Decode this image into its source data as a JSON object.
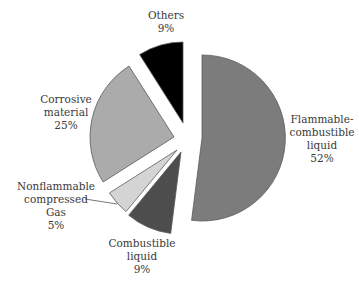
{
  "chart_data": {
    "type": "pie",
    "title": "",
    "exploded": true,
    "start_angle_deg": 90,
    "direction": "clockwise",
    "slices": [
      {
        "key": "flammable",
        "label_lines": [
          "Flammable-",
          "combustible",
          "liquid"
        ],
        "label": "Flammable-combustible liquid",
        "value": 52,
        "value_label": "52%",
        "color": "#7c7c7c",
        "center": [
          202,
          138
        ],
        "radius": 83
      },
      {
        "key": "combustible",
        "label_lines": [
          "Combustible",
          "liquid"
        ],
        "label": "Combustible liquid",
        "value": 9,
        "value_label": "9%",
        "color": "#4d4d4d",
        "center": [
          181,
          152
        ],
        "radius": 82
      },
      {
        "key": "nonflammable",
        "label_lines": [
          "Nonflammable",
          "compressed",
          "Gas"
        ],
        "label": "Nonflammable compressed Gas",
        "value": 5,
        "value_label": "5%",
        "color": "#d4d4d4",
        "center": [
          177,
          150
        ],
        "radius": 80
      },
      {
        "key": "corrosive",
        "label_lines": [
          "Corrosive",
          "material"
        ],
        "label": "Corrosive material",
        "value": 25,
        "value_label": "25%",
        "color": "#ababab",
        "center": [
          174,
          137
        ],
        "radius": 84
      },
      {
        "key": "others",
        "label_lines": [
          "Others"
        ],
        "label": "Others",
        "value": 9,
        "value_label": "9%",
        "color": "#000000",
        "center": [
          183,
          123
        ],
        "radius": 81
      }
    ],
    "stroke_color": "#5a5a5a"
  },
  "labels": {
    "others": {
      "line1": "Others",
      "pct": "9%"
    },
    "corrosive": {
      "line1": "Corrosive",
      "line2": "material",
      "pct": "25%"
    },
    "flammable": {
      "line1": "Flammable-",
      "line2": "combustible",
      "line3": "liquid",
      "pct": "52%"
    },
    "nonflammable": {
      "line1": "Nonflammable",
      "line2": "compressed",
      "line3": "Gas",
      "pct": "5%"
    },
    "combustible": {
      "line1": "Combustible",
      "line2": "liquid",
      "pct": "9%"
    }
  }
}
